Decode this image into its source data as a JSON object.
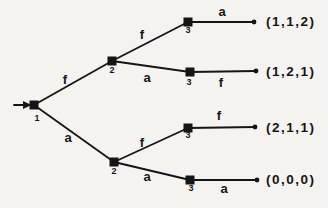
{
  "figure": {
    "kind": "extensive-form-game-tree",
    "colors": {
      "ink": "#151515",
      "paper": "#f5f3f0"
    }
  },
  "tree": {
    "nodes": {
      "root": {
        "label": "1"
      },
      "n2_top": {
        "label": "2"
      },
      "n2_bottom": {
        "label": "2"
      },
      "n3_1": {
        "label": "3"
      },
      "n3_2": {
        "label": "3"
      },
      "n3_3": {
        "label": "3"
      },
      "n3_4": {
        "label": "3"
      }
    },
    "edges": {
      "root_up": {
        "label": "f"
      },
      "root_down": {
        "label": "a"
      },
      "n2_top_up": {
        "label": "f"
      },
      "n2_top_down": {
        "label": "a"
      },
      "n2_bottom_up": {
        "label": "f"
      },
      "n2_bottom_down": {
        "label": "a"
      },
      "n3_1_leaf": {
        "label": "a"
      },
      "n3_2_leaf": {
        "label": "f"
      },
      "n3_3_leaf": {
        "label": "f"
      },
      "n3_4_leaf": {
        "label": "a"
      }
    },
    "outcomes": [
      {
        "payoff": "(1,1,2)"
      },
      {
        "payoff": "(1,2,1)"
      },
      {
        "payoff": "(2,1,1)"
      },
      {
        "payoff": "(0,0,0)"
      }
    ]
  }
}
